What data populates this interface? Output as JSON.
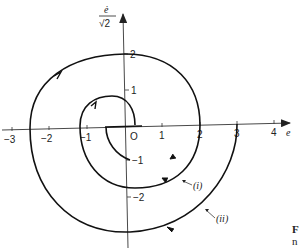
{
  "figure": {
    "x_axis_label": "e",
    "y_axis_label_num": "ė",
    "y_axis_label_den": "√2",
    "origin_label": "O",
    "x_ticks": [
      {
        "value": -3,
        "label": "−3"
      },
      {
        "value": -2,
        "label": "−2"
      },
      {
        "value": -1,
        "label": "−1"
      },
      {
        "value": 1,
        "label": "1"
      },
      {
        "value": 2,
        "label": "2"
      },
      {
        "value": 3,
        "label": "3"
      },
      {
        "value": 4,
        "label": "4"
      }
    ],
    "y_ticks": [
      {
        "value": 2,
        "label": "2"
      },
      {
        "value": 1,
        "label": "1"
      },
      {
        "value": -1,
        "label": "−1"
      },
      {
        "value": -2,
        "label": "−2"
      }
    ],
    "curves": [
      {
        "id": "i",
        "label": "(i)"
      },
      {
        "id": "ii",
        "label": "(ii)"
      }
    ],
    "caption_fragment_line1": "F",
    "caption_fragment_line2": "n"
  },
  "colors": {
    "stroke": "#111111",
    "axis": "#333333",
    "background": "#ffffff"
  }
}
